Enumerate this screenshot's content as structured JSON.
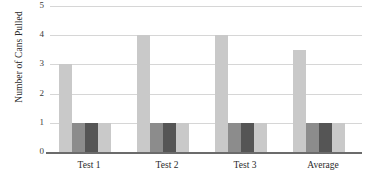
{
  "chart_data": {
    "type": "bar",
    "title": "",
    "xlabel": "",
    "ylabel": "Number of Cans Pulled",
    "categories": [
      "Test 1",
      "Test 2",
      "Test 3",
      "Average"
    ],
    "series": [
      {
        "name": "Series 1",
        "color": "#c9c9c9",
        "values": [
          3,
          4,
          4,
          3.5
        ]
      },
      {
        "name": "Series 2",
        "color": "#8c8c8c",
        "values": [
          1,
          1,
          1,
          1
        ]
      },
      {
        "name": "Series 3",
        "color": "#555555",
        "values": [
          1,
          1,
          1,
          1
        ]
      },
      {
        "name": "Series 4",
        "color": "#c9c9c9",
        "values": [
          1,
          1,
          1,
          1
        ]
      }
    ],
    "ylim": [
      0,
      5
    ],
    "ytick_labels": [
      "5",
      "4",
      "3",
      "2",
      "1",
      "0"
    ],
    "ytick_values": [
      5,
      4,
      3,
      2,
      1,
      0
    ],
    "grid": true,
    "gridline_color": "#d6d6d6",
    "axis_color": "#6b6b6b",
    "legend": "none",
    "background": "#ffffff"
  }
}
